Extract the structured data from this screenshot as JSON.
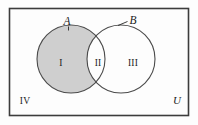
{
  "figure": {
    "type": "venn-diagram",
    "universe_label": "U",
    "sets": [
      {
        "id": "A",
        "label": "A",
        "label_x": 67,
        "label_y": 25
      },
      {
        "id": "B",
        "label": "B",
        "label_x": 132,
        "label_y": 24
      }
    ],
    "regions": [
      {
        "id": "I",
        "label": "I",
        "label_x": 61,
        "label_y": 66,
        "shaded": true,
        "meaning": "A only"
      },
      {
        "id": "II",
        "label": "II",
        "label_x": 98,
        "label_y": 66,
        "shaded": false,
        "meaning": "A and B"
      },
      {
        "id": "III",
        "label": "III",
        "label_x": 132,
        "label_y": 66,
        "shaded": false,
        "meaning": "B only"
      },
      {
        "id": "IV",
        "label": "IV",
        "label_x": 25,
        "label_y": 103,
        "shaded": false,
        "meaning": "outside A and B"
      }
    ],
    "geometry": {
      "rect": {
        "x": 9.5,
        "y": 8.5,
        "width": 179,
        "height": 107
      },
      "circle_a": {
        "cx": 71,
        "cy": 59,
        "r": 34
      },
      "circle_b": {
        "cx": 121,
        "cy": 59,
        "r": 34
      }
    },
    "colors": {
      "shade_fill": "#cfcfcf",
      "stroke": "#4a4a4a",
      "rect_stroke": "#3c3c3c",
      "background": "#fdfdfd",
      "text": "#1b1b1b"
    }
  }
}
